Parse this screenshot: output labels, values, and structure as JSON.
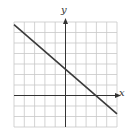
{
  "chart_data": {
    "type": "line",
    "title": "",
    "xlabel": "x",
    "ylabel": "y",
    "xlim": [
      -5,
      5
    ],
    "ylim": [
      -3,
      7
    ],
    "grid": true,
    "series": [
      {
        "name": "line",
        "x": [
          -5,
          3,
          5
        ],
        "y": [
          6.75,
          0,
          -1.75
        ]
      }
    ],
    "y_intercept": 2.5,
    "x_intercept": 3,
    "colors": {
      "grid": "#c8c8c8",
      "axis": "#333333",
      "line": "#3a3a3a"
    }
  }
}
